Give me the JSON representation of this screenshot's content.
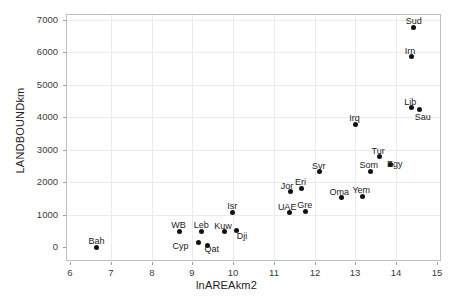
{
  "chart_data": {
    "type": "scatter",
    "title": "",
    "xlabel": "lnAREAkm2",
    "ylabel": "LANDBOUNDkm",
    "xlim": [
      6,
      15
    ],
    "ylim": [
      0,
      7000
    ],
    "xticks": [
      6,
      7,
      8,
      9,
      10,
      11,
      12,
      13,
      14,
      15
    ],
    "yticks": [
      0,
      1000,
      2000,
      3000,
      4000,
      5000,
      6000,
      7000
    ],
    "grid": true,
    "legend": "none",
    "point_label_position": "above",
    "points": [
      {
        "label": "Bah",
        "x": 6.65,
        "y": 0,
        "label_dx": 0,
        "label_dy": -11
      },
      {
        "label": "WB",
        "x": 8.69,
        "y": 480,
        "label_dx": -1,
        "label_dy": -11
      },
      {
        "label": "Cyp",
        "x": 9.15,
        "y": 150,
        "label_dx": -18,
        "label_dy": -1
      },
      {
        "label": "Leb",
        "x": 9.22,
        "y": 480,
        "label_dx": 0,
        "label_dy": -11
      },
      {
        "label": "Qat",
        "x": 9.36,
        "y": 60,
        "label_dx": 5,
        "label_dy": -1
      },
      {
        "label": "Kuw",
        "x": 9.78,
        "y": 475,
        "label_dx": -1,
        "label_dy": -11
      },
      {
        "label": "Isr",
        "x": 9.98,
        "y": 1070,
        "label_dx": 0,
        "label_dy": -11
      },
      {
        "label": "Dji",
        "x": 10.08,
        "y": 520,
        "label_dx": 6,
        "label_dy": 1
      },
      {
        "label": "UAE",
        "x": 11.38,
        "y": 1060,
        "label_dx": -2,
        "label_dy": -11
      },
      {
        "label": "Jor",
        "x": 11.4,
        "y": 1710,
        "label_dx": -3,
        "label_dy": -11
      },
      {
        "label": "Eri",
        "x": 11.68,
        "y": 1800,
        "label_dx": -1,
        "label_dy": -12
      },
      {
        "label": "Gre",
        "x": 11.78,
        "y": 1100,
        "label_dx": -1,
        "label_dy": -11
      },
      {
        "label": "Syr",
        "x": 12.13,
        "y": 2320,
        "label_dx": -1,
        "label_dy": -11
      },
      {
        "label": "Oma",
        "x": 12.66,
        "y": 1520,
        "label_dx": -2,
        "label_dy": -11
      },
      {
        "label": "Irq",
        "x": 13.01,
        "y": 3780,
        "label_dx": -1,
        "label_dy": -11
      },
      {
        "label": "Yem",
        "x": 13.17,
        "y": 1565,
        "label_dx": -1,
        "label_dy": -11
      },
      {
        "label": "Som",
        "x": 13.38,
        "y": 2330,
        "label_dx": -2,
        "label_dy": -11
      },
      {
        "label": "Tur",
        "x": 13.58,
        "y": 2780,
        "label_dx": -1,
        "label_dy": -11
      },
      {
        "label": "Egy",
        "x": 13.85,
        "y": 2550,
        "label_dx": 5,
        "label_dy": -5
      },
      {
        "label": "Lib",
        "x": 14.37,
        "y": 4300,
        "label_dx": -1,
        "label_dy": -11
      },
      {
        "label": "Irn",
        "x": 14.37,
        "y": 5870,
        "label_dx": -1,
        "label_dy": -11
      },
      {
        "label": "Sud",
        "x": 14.43,
        "y": 6780,
        "label_dx": 0,
        "label_dy": -11
      },
      {
        "label": "Sau",
        "x": 14.58,
        "y": 4240,
        "label_dx": 3,
        "label_dy": 2
      }
    ]
  },
  "geometry": {
    "plot_left": 66,
    "plot_top": 14,
    "plot_right": 441,
    "plot_bottom": 261
  }
}
